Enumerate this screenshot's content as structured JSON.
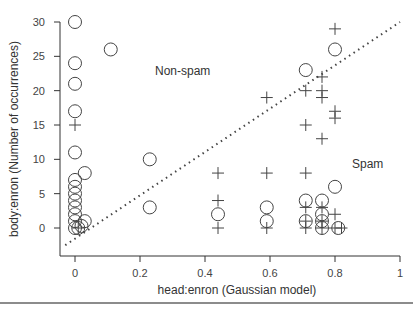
{
  "chart_data": {
    "type": "scatter",
    "title": "",
    "xlabel": "head:enron (Gaussian model)",
    "ylabel": "body:enron (Number of occurrences)",
    "xlim": [
      -0.05,
      1.0
    ],
    "ylim": [
      -2.5,
      31
    ],
    "xticks": [
      0,
      0.2,
      0.4,
      0.6,
      0.8,
      1
    ],
    "xtick_labels": [
      "0",
      "0.2",
      "0.4",
      "0.6",
      "0.8",
      "1"
    ],
    "yticks": [
      0,
      5,
      10,
      15,
      20,
      25,
      30
    ],
    "ytick_labels": [
      "0",
      "5",
      "10",
      "15",
      "20",
      "25",
      "30"
    ],
    "grid": false,
    "legend": null,
    "annotations": [
      {
        "text": "Non-spam",
        "x": 0.27,
        "y": 23
      },
      {
        "text": "Spam",
        "x": 0.88,
        "y": 9
      }
    ],
    "reference_line": {
      "style": "dotted",
      "from": [
        -0.03,
        -2.5
      ],
      "to": [
        1.0,
        30
      ]
    },
    "series": [
      {
        "name": "Non-spam",
        "marker": "circle",
        "points": [
          [
            0,
            30
          ],
          [
            0,
            24
          ],
          [
            0,
            21
          ],
          [
            0,
            17
          ],
          [
            0,
            11
          ],
          [
            0,
            7
          ],
          [
            0,
            6
          ],
          [
            0,
            5
          ],
          [
            0,
            4
          ],
          [
            0,
            3
          ],
          [
            0,
            2
          ],
          [
            0,
            1
          ],
          [
            0,
            0
          ],
          [
            0.01,
            0
          ],
          [
            0.02,
            0.3
          ],
          [
            0.03,
            1
          ],
          [
            0.03,
            8
          ],
          [
            0.11,
            26
          ],
          [
            0.23,
            10
          ],
          [
            0.23,
            3
          ],
          [
            0.44,
            2
          ],
          [
            0.59,
            3
          ],
          [
            0.59,
            1
          ],
          [
            0.71,
            23
          ],
          [
            0.71,
            4
          ],
          [
            0.71,
            1
          ],
          [
            0.76,
            4
          ],
          [
            0.76,
            2
          ],
          [
            0.76,
            1
          ],
          [
            0.76,
            0
          ],
          [
            0.8,
            26
          ],
          [
            0.8,
            6
          ],
          [
            0.81,
            0
          ]
        ]
      },
      {
        "name": "Spam",
        "marker": "plus",
        "points": [
          [
            0,
            15
          ],
          [
            0.01,
            0
          ],
          [
            0.44,
            8
          ],
          [
            0.44,
            4
          ],
          [
            0.44,
            0
          ],
          [
            0.59,
            19
          ],
          [
            0.59,
            8
          ],
          [
            0.59,
            0
          ],
          [
            0.71,
            20
          ],
          [
            0.71,
            15
          ],
          [
            0.71,
            8
          ],
          [
            0.71,
            3
          ],
          [
            0.71,
            1
          ],
          [
            0.71,
            0
          ],
          [
            0.76,
            22
          ],
          [
            0.76,
            20
          ],
          [
            0.76,
            19
          ],
          [
            0.76,
            13
          ],
          [
            0.76,
            3
          ],
          [
            0.76,
            1
          ],
          [
            0.76,
            0
          ],
          [
            0.8,
            29
          ],
          [
            0.8,
            17
          ],
          [
            0.8,
            16
          ],
          [
            0.8,
            2
          ],
          [
            0.8,
            0
          ],
          [
            0.82,
            0
          ]
        ]
      }
    ]
  }
}
